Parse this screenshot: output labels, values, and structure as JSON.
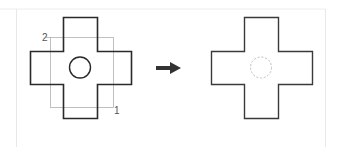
{
  "diagram": {
    "type": "before-after-transformation",
    "colors": {
      "background": "#ffffff",
      "outline": "#2a2a2a",
      "selection_box": "#aaaaaa",
      "hidden_circle": "#c0c0c0",
      "arrow": "#333333",
      "panel_border": "#e6e6e6"
    },
    "before": {
      "shape": "cross",
      "inner_circle": "solid",
      "selection_rectangle": {
        "corner_labels": [
          "2",
          "1"
        ]
      }
    },
    "arrow": {
      "direction": "right"
    },
    "after": {
      "shape": "cross",
      "inner_circle": "dashed"
    }
  }
}
